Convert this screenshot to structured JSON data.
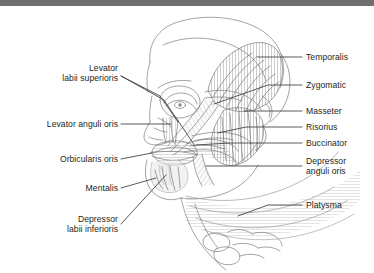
{
  "figure": {
    "type": "anatomical-line-diagram",
    "background_color": "#ffffff",
    "top_bar_color": "#6f6f6f",
    "line_color": "#58585a",
    "leader_color": "#3b3b3d",
    "text_color": "#231f20"
  },
  "labels_left": [
    {
      "id": "levator-labii-superioris",
      "lines": [
        "Levator",
        "labii superioris"
      ],
      "x": 118,
      "y": 68
    },
    {
      "id": "levator-anguli-oris",
      "lines": [
        "Levator anguli oris"
      ],
      "x": 118,
      "y": 122
    },
    {
      "id": "orbicularis-oris",
      "lines": [
        "Orbicularis oris"
      ],
      "x": 118,
      "y": 157
    },
    {
      "id": "mentalis",
      "lines": [
        "Mentalis"
      ],
      "x": 118,
      "y": 186
    },
    {
      "id": "depressor-labii-inferioris",
      "lines": [
        "Depressor",
        "labii inferioris"
      ],
      "x": 118,
      "y": 219
    }
  ],
  "labels_right": [
    {
      "id": "temporalis",
      "lines": [
        "Temporalis"
      ],
      "x": 305,
      "y": 52
    },
    {
      "id": "zygomatic",
      "lines": [
        "Zygomatic"
      ],
      "x": 305,
      "y": 80
    },
    {
      "id": "masseter",
      "lines": [
        "Masseter"
      ],
      "x": 305,
      "y": 106
    },
    {
      "id": "risorius",
      "lines": [
        "Risorius"
      ],
      "x": 305,
      "y": 122
    },
    {
      "id": "buccinator",
      "lines": [
        "Buccinator"
      ],
      "x": 305,
      "y": 138
    },
    {
      "id": "depressor-anguli-oris",
      "lines": [
        "Depressor",
        "anguli oris"
      ],
      "x": 305,
      "y": 161
    },
    {
      "id": "platysma",
      "lines": [
        "Platysma"
      ],
      "x": 305,
      "y": 200
    }
  ]
}
